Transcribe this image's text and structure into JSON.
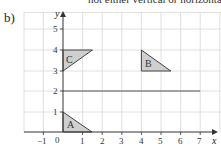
{
  "header": {
    "text": "not either vertical or horizontal)"
  },
  "part_label": "b)",
  "graph": {
    "x_axis": {
      "label": "x",
      "min": -1,
      "max": 7,
      "ticks": [
        "−1",
        "0",
        "1",
        "2",
        "3",
        "4",
        "5",
        "6",
        "7"
      ]
    },
    "y_axis": {
      "label": "y",
      "min": 0,
      "max": 5,
      "ticks": [
        "1",
        "2",
        "3",
        "4",
        "5"
      ]
    },
    "grid": true,
    "line": {
      "label": "y = 2",
      "from": [
        0,
        2
      ],
      "to": [
        7,
        2
      ]
    },
    "shapes": [
      {
        "label": "A",
        "vertices": [
          [
            0,
            1
          ],
          [
            0,
            0
          ],
          [
            1.5,
            0
          ]
        ]
      },
      {
        "label": "B",
        "vertices": [
          [
            4,
            4
          ],
          [
            4,
            3
          ],
          [
            5.5,
            3
          ]
        ]
      },
      {
        "label": "C",
        "vertices": [
          [
            0,
            4
          ],
          [
            1.5,
            4
          ],
          [
            0,
            3
          ]
        ]
      }
    ],
    "colors": {
      "shape_fill": "#cfcfcf",
      "grid": "#d8d8d8",
      "axis": "#333333"
    }
  }
}
